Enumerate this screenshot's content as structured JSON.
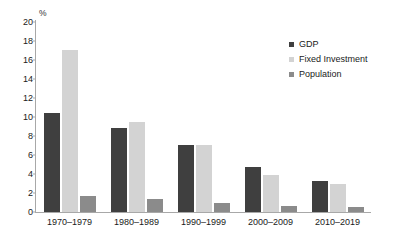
{
  "chart_data": {
    "type": "bar",
    "title": "",
    "xlabel": "",
    "ylabel": "%",
    "ylim": [
      0,
      20
    ],
    "ytick_step": 2,
    "yticks": [
      "20",
      "18",
      "16",
      "14",
      "12",
      "10",
      "8",
      "6",
      "4",
      "2",
      "0"
    ],
    "grid": false,
    "legend_position": "top-right",
    "categories": [
      "1970–1979",
      "1980–1989",
      "1990–1999",
      "2000–2009",
      "2010–2019"
    ],
    "series": [
      {
        "name": "GDP",
        "color": "#3f3f3f",
        "values": [
          10.4,
          8.8,
          7.1,
          4.7,
          3.3
        ]
      },
      {
        "name": "Fixed Investment",
        "color": "#d3d3d3",
        "values": [
          17.1,
          9.5,
          7.1,
          3.9,
          3.0
        ]
      },
      {
        "name": "Population",
        "color": "#8b8b8b",
        "values": [
          1.7,
          1.4,
          1.0,
          0.6,
          0.5
        ]
      }
    ]
  },
  "axis": {
    "unit_label": "%"
  },
  "legend": {
    "items": [
      {
        "label": "GDP"
      },
      {
        "label": "Fixed Investment"
      },
      {
        "label": "Population"
      }
    ]
  },
  "colors": {
    "series_gdp": "#3f3f3f",
    "series_fixed_investment": "#d3d3d3",
    "series_population": "#8b8b8b",
    "axis": "#a8a8a8",
    "background": "#ffffff",
    "text": "#1a1a1a"
  }
}
